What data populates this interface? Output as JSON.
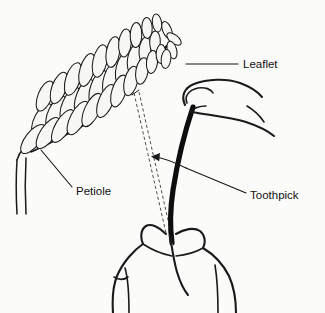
{
  "figure": {
    "kind": "botanical-line-diagram",
    "background_color": "#fbfbfa",
    "ink_color": "#1a1a1a",
    "toothpick_color": "#0d0d0d",
    "leaflet_fill": "#f7f7f5",
    "width": 325,
    "height": 313
  },
  "callouts": [
    {
      "id": "leaflet",
      "label": "Leaflet",
      "text_x": 243,
      "text_y": 65,
      "leader": "M 238 64 L 186 64"
    },
    {
      "id": "petiole",
      "label": "Petiole",
      "text_x": 76,
      "text_y": 192,
      "leader": "M 72 187 L 41 150"
    },
    {
      "id": "toothpick",
      "label": "Toothpick",
      "text_x": 250,
      "text_y": 196,
      "leader": "M 246 193 L 186 168"
    }
  ],
  "arrow": {
    "id": "motion-arrow",
    "tip_x": 153,
    "tip_y": 157,
    "direction": "left"
  },
  "parts": {
    "leaf": "pinnately compound leaf with paired elliptical leaflets",
    "rachis": "curved central axis of the leaf",
    "petiole": "leaf stalk joining the stem",
    "upper_hand": "index finger and thumb holding the toothpick near the top",
    "lower_hand": "fingers gripping the toothpick below",
    "motion_path": "two dashed lines tracing the toothpick swing toward the leaflet"
  }
}
